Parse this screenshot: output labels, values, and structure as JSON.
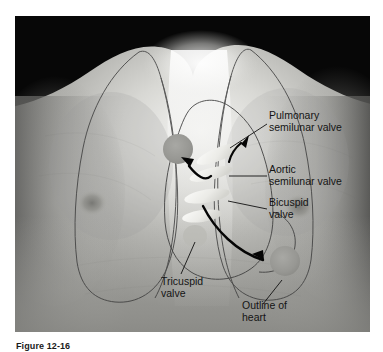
{
  "figure": {
    "caption_label": "Figure 12-16",
    "caption_rest": "",
    "alt_description": "Grayscale photograph of a human chest with overlaid outlines of the lungs and heart, showing the surface projection of the four heart valves and their auscultation sites."
  },
  "labels": [
    {
      "id": "pulmonary-semilunar-valve",
      "line1": "Pulmonary",
      "line2": "semilunar valve"
    },
    {
      "id": "aortic-semilunar-valve",
      "line1": "Aortic",
      "line2": "semilunar valve"
    },
    {
      "id": "bicuspid-valve",
      "line1": "Bicuspid",
      "line2": "valve"
    },
    {
      "id": "tricuspid-valve",
      "line1": "Tricuspid",
      "line2": "valve"
    },
    {
      "id": "outline-of-heart",
      "line1": "Outline of",
      "line2": "heart"
    }
  ],
  "colors": {
    "label_text": "#1a1a1a",
    "leader_line": "#1a1a1a",
    "arrow": "#000000",
    "outline_stroke": "#3c3c3c",
    "auscultation_marker": "#9a9a9a",
    "valve_marker": "#e8e8e4",
    "plate_background": "#000000",
    "page_background": "#ffffff"
  },
  "markers": {
    "auscultation_sites": [
      {
        "id": "pulmonic-site",
        "label": "pulmonic auscultation site"
      },
      {
        "id": "mitral-site",
        "label": "mitral auscultation site"
      }
    ],
    "valve_positions": [
      {
        "id": "pulmonary-valve-marker"
      },
      {
        "id": "aortic-valve-marker"
      },
      {
        "id": "bicuspid-valve-marker"
      },
      {
        "id": "tricuspid-valve-marker"
      }
    ]
  }
}
